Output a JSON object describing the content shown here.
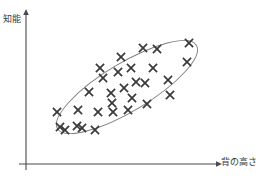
{
  "figure": {
    "title": "",
    "background_color": "#ffffff",
    "axis_color": "#4a4a4a",
    "marker_color": "#3a3a3a",
    "ellipse_color": "#7a7a7a"
  },
  "axes": {
    "y_label": "知能",
    "x_label": "背の高さ",
    "y_axis_top": 12,
    "y_axis_bottom": 170,
    "x_axis_left": 26,
    "x_axis_right": 222,
    "origin_x": 26,
    "origin_y": 164,
    "has_arrow_heads": true,
    "has_tick_labels": false,
    "has_gridlines": false
  },
  "chart_data": {
    "type": "scatter",
    "title": "",
    "xlabel": "背の高さ",
    "ylabel": "知能",
    "xlim": [
      0,
      100
    ],
    "ylim": [
      0,
      100
    ],
    "grid": false,
    "legend": "none",
    "marker_symbol": "x",
    "n_points": 30,
    "correlation": "positive",
    "annotations": [
      {
        "type": "ellipse",
        "note": "tilted ellipse enclosing the point cloud",
        "center_x": 127,
        "center_y": 87,
        "radius_x": 81,
        "radius_y": 24,
        "rotation_deg": -31
      }
    ],
    "points_px": [
      [
        57,
        112
      ],
      [
        78,
        110
      ],
      [
        98,
        112
      ],
      [
        65,
        130
      ],
      [
        82,
        128
      ],
      [
        95,
        130
      ],
      [
        89,
        92
      ],
      [
        111,
        93
      ],
      [
        103,
        78
      ],
      [
        118,
        72
      ],
      [
        124,
        88
      ],
      [
        113,
        112
      ],
      [
        128,
        110
      ],
      [
        132,
        98
      ],
      [
        143,
        48
      ],
      [
        157,
        49
      ],
      [
        131,
        68
      ],
      [
        136,
        82
      ],
      [
        147,
        104
      ],
      [
        153,
        68
      ],
      [
        168,
        80
      ],
      [
        189,
        43
      ],
      [
        187,
        62
      ],
      [
        170,
        95
      ],
      [
        100,
        68
      ],
      [
        121,
        57
      ],
      [
        77,
        126
      ],
      [
        60,
        127
      ],
      [
        145,
        83
      ],
      [
        112,
        103
      ]
    ],
    "points": [
      {
        "x": 16,
        "y": 33
      },
      {
        "x": 27,
        "y": 34
      },
      {
        "x": 37,
        "y": 33
      },
      {
        "x": 20,
        "y": 22
      },
      {
        "x": 29,
        "y": 23
      },
      {
        "x": 35,
        "y": 22
      },
      {
        "x": 32,
        "y": 45
      },
      {
        "x": 43,
        "y": 45
      },
      {
        "x": 39,
        "y": 54
      },
      {
        "x": 47,
        "y": 58
      },
      {
        "x": 50,
        "y": 48
      },
      {
        "x": 44,
        "y": 33
      },
      {
        "x": 52,
        "y": 34
      },
      {
        "x": 54,
        "y": 41
      },
      {
        "x": 60,
        "y": 73
      },
      {
        "x": 67,
        "y": 73
      },
      {
        "x": 54,
        "y": 59
      },
      {
        "x": 56,
        "y": 51
      },
      {
        "x": 62,
        "y": 38
      },
      {
        "x": 65,
        "y": 59
      },
      {
        "x": 72,
        "y": 51
      },
      {
        "x": 83,
        "y": 76
      },
      {
        "x": 82,
        "y": 64
      },
      {
        "x": 73,
        "y": 44
      },
      {
        "x": 38,
        "y": 59
      },
      {
        "x": 49,
        "y": 65
      },
      {
        "x": 26,
        "y": 24
      },
      {
        "x": 17,
        "y": 23
      },
      {
        "x": 61,
        "y": 50
      },
      {
        "x": 44,
        "y": 39
      }
    ]
  }
}
